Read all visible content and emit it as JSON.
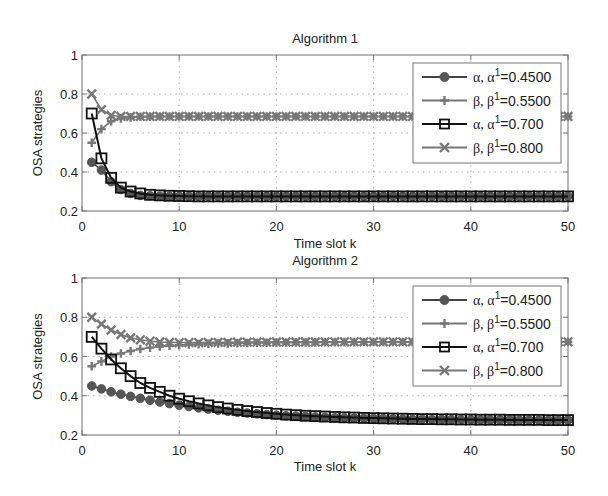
{
  "figure": {
    "background": "#ffffff"
  },
  "chart_data": [
    {
      "type": "line",
      "title": "Algorithm 1",
      "xlabel": "Time slot k",
      "ylabel": "OSA strategies",
      "xlim": [
        0,
        50
      ],
      "ylim": [
        0.2,
        1
      ],
      "xticks": [
        0,
        10,
        20,
        30,
        40,
        50
      ],
      "yticks": [
        0.2,
        0.4,
        0.6,
        0.8,
        1
      ],
      "ytick_labels": [
        "0.2",
        "0.4",
        "0.6",
        "0.8",
        "1"
      ],
      "grid": true,
      "legend_position": "upper right",
      "x": [
        1,
        2,
        3,
        4,
        5,
        6,
        7,
        8,
        9,
        10,
        11,
        12,
        13,
        14,
        15,
        16,
        17,
        18,
        19,
        20,
        21,
        22,
        23,
        24,
        25,
        26,
        27,
        28,
        29,
        30,
        31,
        32,
        33,
        34,
        35,
        36,
        37,
        38,
        39,
        40,
        41,
        42,
        43,
        44,
        45,
        46,
        47,
        48,
        49,
        50
      ],
      "series": [
        {
          "name": "α, α¹=0.4500",
          "legend_prefix": "α, α",
          "legend_sup": "1",
          "legend_suffix": "=0.4500",
          "marker": "circle",
          "color": "#555555",
          "line_color": "#444444",
          "values": [
            0.45,
            0.41,
            0.35,
            0.31,
            0.29,
            0.28,
            0.278,
            0.276,
            0.275,
            0.275,
            0.275,
            0.275,
            0.275,
            0.275,
            0.275,
            0.275,
            0.275,
            0.275,
            0.275,
            0.275,
            0.275,
            0.275,
            0.275,
            0.275,
            0.275,
            0.275,
            0.275,
            0.275,
            0.275,
            0.275,
            0.275,
            0.275,
            0.275,
            0.275,
            0.275,
            0.275,
            0.275,
            0.275,
            0.275,
            0.275,
            0.275,
            0.275,
            0.275,
            0.275,
            0.275,
            0.275,
            0.275,
            0.275,
            0.275,
            0.275
          ]
        },
        {
          "name": "β, β¹=0.5500",
          "legend_prefix": "β, β",
          "legend_sup": "1",
          "legend_suffix": "=0.5500",
          "marker": "plus",
          "color": "#777777",
          "line_color": "#777777",
          "values": [
            0.55,
            0.62,
            0.66,
            0.675,
            0.68,
            0.683,
            0.684,
            0.685,
            0.685,
            0.685,
            0.685,
            0.685,
            0.685,
            0.685,
            0.685,
            0.685,
            0.685,
            0.685,
            0.685,
            0.685,
            0.685,
            0.685,
            0.685,
            0.685,
            0.685,
            0.685,
            0.685,
            0.685,
            0.685,
            0.685,
            0.685,
            0.685,
            0.685,
            0.685,
            0.685,
            0.685,
            0.685,
            0.685,
            0.685,
            0.685,
            0.685,
            0.685,
            0.685,
            0.685,
            0.685,
            0.685,
            0.685,
            0.685,
            0.685,
            0.685
          ]
        },
        {
          "name": "α, α¹=0.700",
          "legend_prefix": "α, α",
          "legend_sup": "1",
          "legend_suffix": "=0.700",
          "marker": "square",
          "color": "#111111",
          "line_color": "#111111",
          "values": [
            0.7,
            0.47,
            0.37,
            0.32,
            0.3,
            0.29,
            0.283,
            0.28,
            0.278,
            0.277,
            0.276,
            0.275,
            0.275,
            0.275,
            0.275,
            0.275,
            0.275,
            0.275,
            0.275,
            0.275,
            0.275,
            0.275,
            0.275,
            0.275,
            0.275,
            0.275,
            0.275,
            0.275,
            0.275,
            0.275,
            0.275,
            0.275,
            0.275,
            0.275,
            0.275,
            0.275,
            0.275,
            0.275,
            0.275,
            0.275,
            0.275,
            0.275,
            0.275,
            0.275,
            0.275,
            0.275,
            0.275,
            0.275,
            0.275,
            0.275
          ]
        },
        {
          "name": "β, β¹=0.800",
          "legend_prefix": "β, β",
          "legend_sup": "1",
          "legend_suffix": "=0.800",
          "marker": "x",
          "color": "#777777",
          "line_color": "#777777",
          "values": [
            0.8,
            0.72,
            0.69,
            0.685,
            0.685,
            0.685,
            0.685,
            0.685,
            0.685,
            0.685,
            0.685,
            0.685,
            0.685,
            0.685,
            0.685,
            0.685,
            0.685,
            0.685,
            0.685,
            0.685,
            0.685,
            0.685,
            0.685,
            0.685,
            0.685,
            0.685,
            0.685,
            0.685,
            0.685,
            0.685,
            0.685,
            0.685,
            0.685,
            0.685,
            0.685,
            0.685,
            0.685,
            0.685,
            0.685,
            0.685,
            0.685,
            0.685,
            0.685,
            0.685,
            0.685,
            0.685,
            0.685,
            0.685,
            0.685,
            0.685
          ]
        }
      ]
    },
    {
      "type": "line",
      "title": "Algorithm 2",
      "xlabel": "Time slot k",
      "ylabel": "OSA strategies",
      "xlim": [
        0,
        50
      ],
      "ylim": [
        0.2,
        1
      ],
      "xticks": [
        0,
        10,
        20,
        30,
        40,
        50
      ],
      "yticks": [
        0.2,
        0.4,
        0.6,
        0.8,
        1
      ],
      "ytick_labels": [
        "0.2",
        "0.4",
        "0.6",
        "0.8",
        "1"
      ],
      "grid": true,
      "legend_position": "upper right",
      "x": [
        1,
        2,
        3,
        4,
        5,
        6,
        7,
        8,
        9,
        10,
        11,
        12,
        13,
        14,
        15,
        16,
        17,
        18,
        19,
        20,
        21,
        22,
        23,
        24,
        25,
        26,
        27,
        28,
        29,
        30,
        31,
        32,
        33,
        34,
        35,
        36,
        37,
        38,
        39,
        40,
        41,
        42,
        43,
        44,
        45,
        46,
        47,
        48,
        49,
        50
      ],
      "series": [
        {
          "name": "α, α¹=0.4500",
          "legend_prefix": "α, α",
          "legend_sup": "1",
          "legend_suffix": "=0.4500",
          "marker": "circle",
          "color": "#555555",
          "line_color": "#444444",
          "values": [
            0.45,
            0.435,
            0.42,
            0.408,
            0.397,
            0.387,
            0.377,
            0.368,
            0.36,
            0.352,
            0.345,
            0.338,
            0.332,
            0.326,
            0.321,
            0.316,
            0.312,
            0.308,
            0.304,
            0.301,
            0.298,
            0.296,
            0.294,
            0.292,
            0.29,
            0.288,
            0.287,
            0.286,
            0.285,
            0.284,
            0.283,
            0.282,
            0.281,
            0.28,
            0.28,
            0.279,
            0.279,
            0.278,
            0.278,
            0.278,
            0.277,
            0.277,
            0.277,
            0.277,
            0.276,
            0.276,
            0.276,
            0.276,
            0.276,
            0.276
          ]
        },
        {
          "name": "β, β¹=0.5500",
          "legend_prefix": "β, β",
          "legend_sup": "1",
          "legend_suffix": "=0.5500",
          "marker": "plus",
          "color": "#777777",
          "line_color": "#777777",
          "values": [
            0.55,
            0.575,
            0.6,
            0.615,
            0.628,
            0.638,
            0.645,
            0.651,
            0.655,
            0.658,
            0.661,
            0.663,
            0.665,
            0.666,
            0.667,
            0.668,
            0.669,
            0.67,
            0.67,
            0.671,
            0.671,
            0.672,
            0.672,
            0.672,
            0.673,
            0.673,
            0.673,
            0.673,
            0.674,
            0.674,
            0.674,
            0.674,
            0.674,
            0.674,
            0.675,
            0.675,
            0.675,
            0.675,
            0.675,
            0.675,
            0.675,
            0.675,
            0.675,
            0.675,
            0.675,
            0.675,
            0.675,
            0.675,
            0.675,
            0.675
          ]
        },
        {
          "name": "α, α¹=0.700",
          "legend_prefix": "α, α",
          "legend_sup": "1",
          "legend_suffix": "=0.700",
          "marker": "square",
          "color": "#111111",
          "line_color": "#111111",
          "values": [
            0.7,
            0.64,
            0.585,
            0.54,
            0.5,
            0.465,
            0.44,
            0.42,
            0.4,
            0.385,
            0.372,
            0.361,
            0.351,
            0.342,
            0.335,
            0.328,
            0.322,
            0.317,
            0.312,
            0.308,
            0.304,
            0.301,
            0.298,
            0.296,
            0.294,
            0.292,
            0.29,
            0.289,
            0.287,
            0.286,
            0.285,
            0.284,
            0.283,
            0.282,
            0.281,
            0.281,
            0.28,
            0.28,
            0.279,
            0.279,
            0.278,
            0.278,
            0.278,
            0.277,
            0.277,
            0.277,
            0.277,
            0.276,
            0.276,
            0.276
          ]
        },
        {
          "name": "β, β¹=0.800",
          "legend_prefix": "β, β",
          "legend_sup": "1",
          "legend_suffix": "=0.800",
          "marker": "x",
          "color": "#777777",
          "line_color": "#777777",
          "values": [
            0.8,
            0.765,
            0.735,
            0.712,
            0.695,
            0.685,
            0.678,
            0.674,
            0.672,
            0.671,
            0.671,
            0.671,
            0.672,
            0.672,
            0.672,
            0.673,
            0.673,
            0.673,
            0.673,
            0.674,
            0.674,
            0.674,
            0.674,
            0.674,
            0.674,
            0.675,
            0.675,
            0.675,
            0.675,
            0.675,
            0.675,
            0.675,
            0.675,
            0.675,
            0.675,
            0.675,
            0.675,
            0.675,
            0.675,
            0.675,
            0.675,
            0.675,
            0.675,
            0.675,
            0.675,
            0.675,
            0.675,
            0.675,
            0.675,
            0.675
          ]
        }
      ]
    }
  ],
  "layout": [
    {
      "plot_left": 82,
      "plot_right": 568,
      "plot_top": 55,
      "plot_bottom": 211,
      "title_y": 43,
      "ticklabel_y": 231,
      "xlabel_y": 248,
      "ylabel_x": 42,
      "legend": {
        "x": 413,
        "y": 63,
        "w": 148,
        "h": 100
      }
    },
    {
      "plot_left": 82,
      "plot_right": 568,
      "plot_top": 278,
      "plot_bottom": 435,
      "title_y": 265,
      "ticklabel_y": 455,
      "xlabel_y": 471,
      "ylabel_x": 42,
      "legend": {
        "x": 413,
        "y": 286,
        "w": 148,
        "h": 100
      }
    }
  ]
}
